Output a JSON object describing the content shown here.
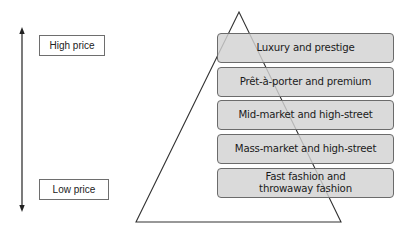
{
  "price_axis": {
    "high_label": "High price",
    "low_label": "Low price"
  },
  "pyramid": {
    "tiers": [
      {
        "label": "Luxury and prestige"
      },
      {
        "label": "Prêt-à-porter and premium"
      },
      {
        "label": "Mid-market and high-street"
      },
      {
        "label": "Mass-market and high-street"
      },
      {
        "label": "Fast fashion and throwaway fashion"
      }
    ]
  },
  "colors": {
    "tier_fill": "#d2d2d2",
    "tier_border": "#6b6b6b",
    "line": "#333333"
  }
}
